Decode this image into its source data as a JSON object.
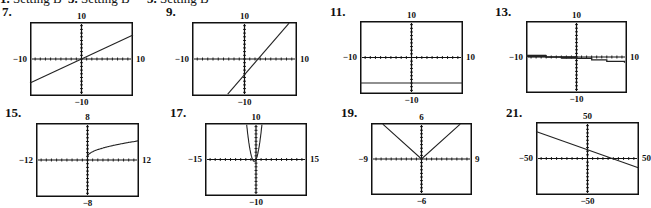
{
  "header_items": [
    {
      "number": "1.",
      "text": "Setting B",
      "x": 0
    },
    {
      "number": "3.",
      "text": "Setting B",
      "x": 68
    },
    {
      "number": "5.",
      "text": "Setting B",
      "x": 147
    }
  ],
  "graphs": [
    {
      "number": "7.",
      "num_x": 2,
      "num_y": 12,
      "box": {
        "x": 30,
        "y": 22,
        "w": 103,
        "h": 74
      },
      "window": {
        "xmin": -10,
        "xmax": 10,
        "ymin": -10,
        "ymax": 10
      },
      "labels": {
        "top": "10",
        "bottom": "−10",
        "left": "−10",
        "right": "10"
      },
      "curve": {
        "type": "line",
        "points": [
          [
            -10,
            -6.5
          ],
          [
            10,
            6.5
          ]
        ]
      }
    },
    {
      "number": "9.",
      "num_x": 166,
      "num_y": 12,
      "box": {
        "x": 192,
        "y": 22,
        "w": 105,
        "h": 74
      },
      "window": {
        "xmin": -10,
        "xmax": 10,
        "ymin": -10,
        "ymax": 10
      },
      "labels": {
        "top": "10",
        "bottom": "−10",
        "left": "−10",
        "right": "10"
      },
      "curve": {
        "type": "line",
        "points": [
          [
            -3.2,
            -9.5
          ],
          [
            8.5,
            9.7
          ]
        ]
      }
    },
    {
      "number": "11.",
      "num_x": 330,
      "num_y": 12,
      "box": {
        "x": 360,
        "y": 21,
        "w": 103,
        "h": 73
      },
      "window": {
        "xmin": -10,
        "xmax": 10,
        "ymin": -10,
        "ymax": 10
      },
      "labels": {
        "top": "10",
        "bottom": "−10",
        "left": "−10",
        "right": "10"
      },
      "curve": {
        "type": "line",
        "points": [
          [
            -10,
            -7
          ],
          [
            10,
            -7
          ]
        ]
      }
    },
    {
      "number": "13.",
      "num_x": 495,
      "num_y": 12,
      "box": {
        "x": 526,
        "y": 21,
        "w": 101,
        "h": 72
      },
      "window": {
        "xmin": -10,
        "xmax": 10,
        "ymin": -10,
        "ymax": 10
      },
      "labels": {
        "top": "10",
        "bottom": "−10",
        "left": "−10",
        "right": "10"
      },
      "curve": {
        "type": "polyline",
        "points": [
          [
            -10,
            0.3
          ],
          [
            -6,
            0.3
          ],
          [
            -6,
            0
          ],
          [
            -3,
            0
          ],
          [
            -3,
            -0.15
          ],
          [
            0,
            -0.15
          ],
          [
            0,
            -0.4
          ],
          [
            3,
            -0.4
          ],
          [
            3,
            -0.8
          ],
          [
            6,
            -0.8
          ],
          [
            6,
            -1.2
          ],
          [
            9.5,
            -1.2
          ],
          [
            9.5,
            -1.6
          ]
        ]
      }
    },
    {
      "number": "15.",
      "num_x": 5,
      "num_y": 113,
      "box": {
        "x": 36,
        "y": 123,
        "w": 103,
        "h": 74
      },
      "window": {
        "xmin": -12,
        "xmax": 12,
        "ymin": -8,
        "ymax": 8
      },
      "labels": {
        "top": "8",
        "bottom": "−8",
        "left": "−12",
        "right": "12"
      },
      "curve": {
        "type": "function",
        "fn": "sqrt",
        "domain": [
          0,
          12
        ],
        "params": {
          "a": 1.0,
          "c": 0.7
        }
      }
    },
    {
      "number": "17.",
      "num_x": 170,
      "num_y": 113,
      "box": {
        "x": 205,
        "y": 123,
        "w": 102,
        "h": 73
      },
      "window": {
        "xmin": -15,
        "xmax": 15,
        "ymin": -10,
        "ymax": 10
      },
      "labels": {
        "top": "10",
        "bottom": "−10",
        "left": "−15",
        "right": "15"
      },
      "curve": {
        "type": "function",
        "fn": "parabola",
        "domain": [
          -3.3,
          2.3
        ],
        "params": {
          "a": 2.0,
          "r1": -1,
          "r2": 0
        }
      }
    },
    {
      "number": "19.",
      "num_x": 341,
      "num_y": 113,
      "box": {
        "x": 371,
        "y": 123,
        "w": 101,
        "h": 72
      },
      "window": {
        "xmin": -9,
        "xmax": 9,
        "ymin": -6,
        "ymax": 6
      },
      "labels": {
        "top": "6",
        "bottom": "−6",
        "left": "−9",
        "right": "9"
      },
      "curve": {
        "type": "polyline",
        "points": [
          [
            -6.9,
            5.8
          ],
          [
            0,
            0
          ],
          [
            6.9,
            5.8
          ]
        ]
      }
    },
    {
      "number": "21.",
      "num_x": 506,
      "num_y": 113,
      "box": {
        "x": 536,
        "y": 122,
        "w": 103,
        "h": 73
      },
      "window": {
        "xmin": -50,
        "xmax": 50,
        "ymin": -50,
        "ymax": 50
      },
      "labels": {
        "top": "50",
        "bottom": "−50",
        "left": "−50",
        "right": "50"
      },
      "curve": {
        "type": "line",
        "points": [
          [
            -50,
            37
          ],
          [
            50,
            -13
          ]
        ]
      }
    }
  ],
  "colors": {
    "ink": "#111111",
    "curve": "#222222",
    "background": "#ffffff"
  }
}
